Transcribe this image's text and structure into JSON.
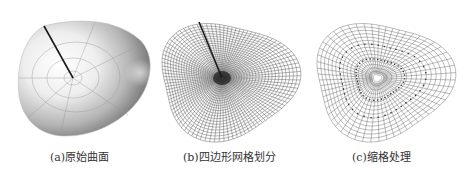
{
  "figure": {
    "panels": [
      {
        "id": "a",
        "caption": "(a)原始曲面",
        "kind": "shaded-surface"
      },
      {
        "id": "b",
        "caption": "(b)四边形网格划分",
        "kind": "quad-mesh"
      },
      {
        "id": "c",
        "caption": "(c)缩格处理",
        "kind": "coarsened-mesh"
      }
    ]
  },
  "colors": {
    "background": "#ffffff",
    "caption_text": "#333333",
    "mesh_line": "#555555",
    "seam_line": "#1a1a1a"
  }
}
